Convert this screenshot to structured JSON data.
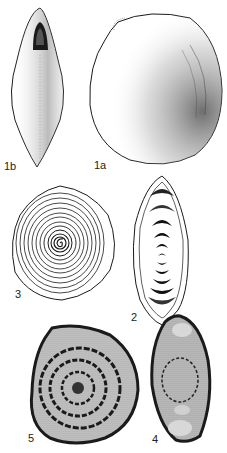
{
  "plate": {
    "figures": [
      {
        "id": "1a",
        "label": "1a",
        "description": "external view, dorsal side"
      },
      {
        "id": "1b",
        "label": "1b",
        "description": "external view, apertural side (fusiform)"
      },
      {
        "id": "2",
        "label": "2",
        "description": "axial section drawing"
      },
      {
        "id": "3",
        "label": "3",
        "description": "equatorial section drawing, spiral whorls"
      },
      {
        "id": "4",
        "label": "4",
        "description": "axial thin-section micrograph"
      },
      {
        "id": "5",
        "label": "5",
        "description": "equatorial thin-section micrograph"
      }
    ]
  },
  "colors": {
    "ink": "#1a1a1a",
    "micrograph_bg": "#c8c8c8",
    "paper": "#ffffff"
  }
}
